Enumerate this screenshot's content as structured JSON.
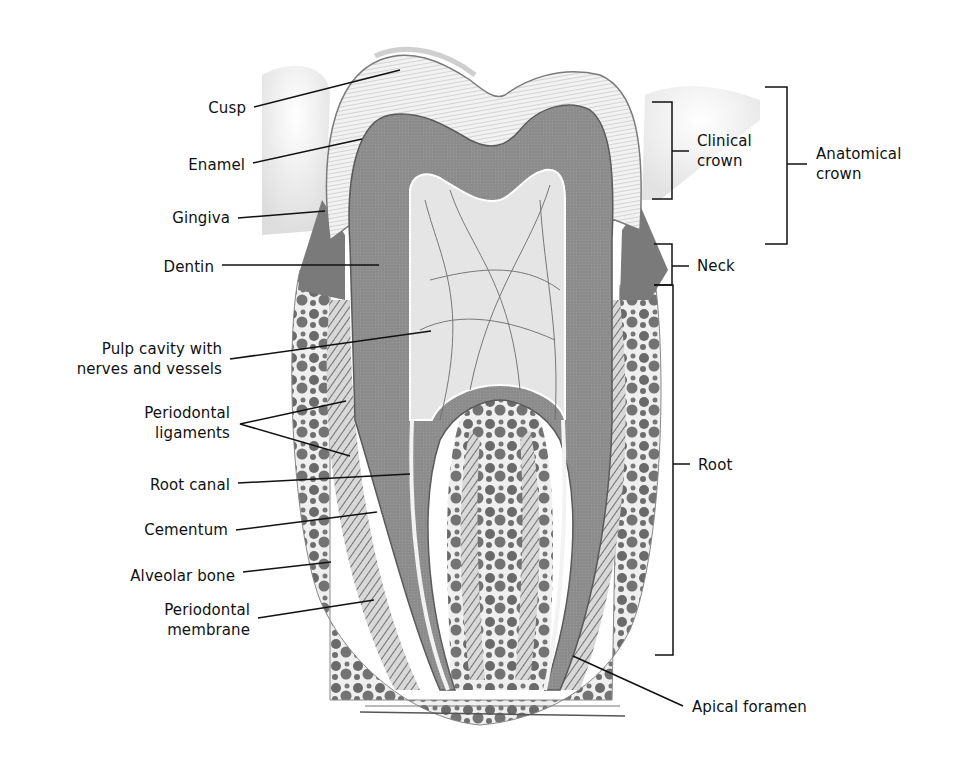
{
  "diagram": {
    "title": "",
    "colors": {
      "background": "#ffffff",
      "dentin": "#8f8f8f",
      "enamel": "#ececec",
      "pulp": "#e3e3e3",
      "bone": "#6e6e6e",
      "gingiva": "#7a7a7a",
      "line": "#111111"
    },
    "left_labels": [
      {
        "id": "cusp",
        "lines": [
          "Cusp"
        ]
      },
      {
        "id": "enamel",
        "lines": [
          "Enamel"
        ]
      },
      {
        "id": "gingiva",
        "lines": [
          "Gingiva"
        ]
      },
      {
        "id": "dentin",
        "lines": [
          "Dentin"
        ]
      },
      {
        "id": "pulp-cavity",
        "lines": [
          "Pulp cavity with",
          "nerves and vessels"
        ]
      },
      {
        "id": "periodontal-ligaments",
        "lines": [
          "Periodontal",
          "ligaments"
        ]
      },
      {
        "id": "root-canal",
        "lines": [
          "Root canal"
        ]
      },
      {
        "id": "cementum",
        "lines": [
          "Cementum"
        ]
      },
      {
        "id": "alveolar-bone",
        "lines": [
          "Alveolar bone"
        ]
      },
      {
        "id": "periodontal-membrane",
        "lines": [
          "Periodontal",
          "membrane"
        ]
      }
    ],
    "right_labels": [
      {
        "id": "clinical-crown",
        "lines": [
          "Clinical",
          "crown"
        ]
      },
      {
        "id": "anatomical-crown",
        "lines": [
          "Anatomical",
          "crown"
        ]
      },
      {
        "id": "neck",
        "lines": [
          "Neck"
        ]
      },
      {
        "id": "root",
        "lines": [
          "Root"
        ]
      },
      {
        "id": "apical-foramen",
        "lines": [
          "Apical foramen"
        ]
      }
    ]
  }
}
